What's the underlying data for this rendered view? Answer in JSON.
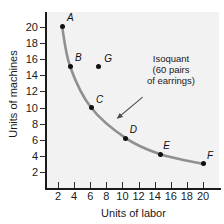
{
  "chart_data": {
    "type": "line",
    "title": "",
    "xlabel": "Units of labor",
    "ylabel": "Units of machines",
    "xlim": [
      0,
      21.5
    ],
    "ylim": [
      0,
      21.5
    ],
    "xticks": [
      2,
      4,
      6,
      8,
      10,
      12,
      14,
      16,
      18,
      20
    ],
    "yticks": [
      2,
      4,
      6,
      8,
      10,
      12,
      14,
      16,
      18,
      20
    ],
    "grid": false,
    "legend": "none",
    "curve_color": "#909090",
    "point_color": "#111111",
    "background_color": "#f2f2f2",
    "annotations": [
      {
        "name": "isoquant-label",
        "lines": [
          "Isoquant",
          "(60 pairs",
          "of earrings)"
        ],
        "arrow_from": [
          12.5,
          11.3
        ],
        "arrow_to": [
          9.3,
          8.6
        ]
      }
    ],
    "series": [
      {
        "name": "Isoquant (60 pairs of earrings)",
        "type": "curve",
        "points": [
          {
            "label": "A",
            "x": 2.5,
            "y": 20.1,
            "on_curve": true
          },
          {
            "label": "B",
            "x": 3.5,
            "y": 15.1,
            "on_curve": true
          },
          {
            "label": "C",
            "x": 6.1,
            "y": 10.0,
            "on_curve": true
          },
          {
            "label": "D",
            "x": 10.4,
            "y": 6.2,
            "on_curve": true
          },
          {
            "label": "E",
            "x": 14.7,
            "y": 4.2,
            "on_curve": true
          },
          {
            "label": "F",
            "x": 20.0,
            "y": 3.0,
            "on_curve": true
          }
        ]
      },
      {
        "name": "Off-curve point",
        "type": "scatter",
        "points": [
          {
            "label": "G",
            "x": 7.0,
            "y": 15.1,
            "on_curve": false
          }
        ]
      }
    ]
  }
}
